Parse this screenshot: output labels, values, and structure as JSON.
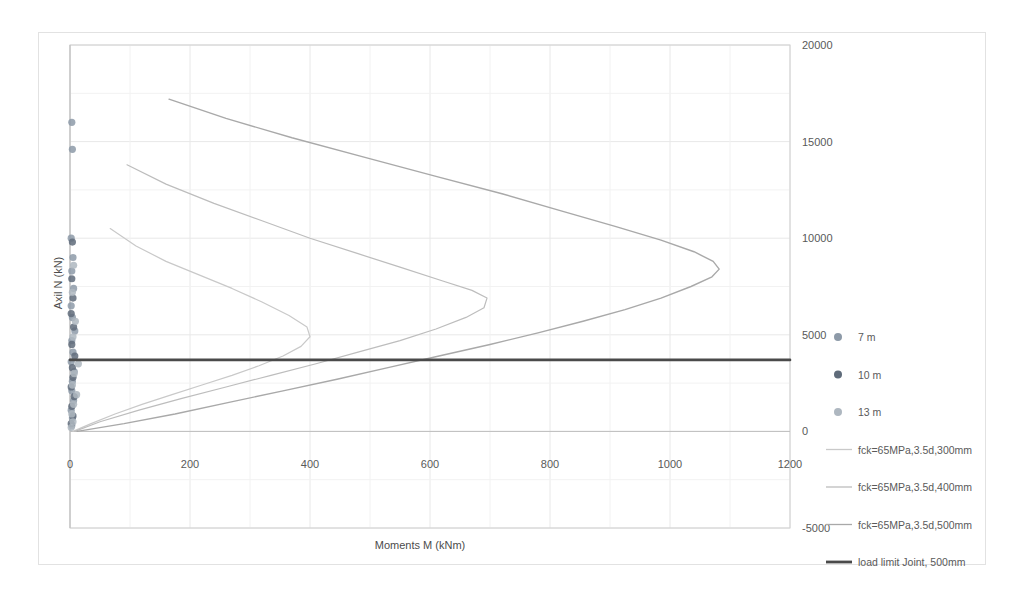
{
  "chart_data": {
    "type": "scatter",
    "title": "",
    "xlabel": "Moments M (kNm)",
    "ylabel": "Axil N (kN)",
    "xlim": [
      0,
      1200
    ],
    "ylim": [
      -5000,
      20000
    ],
    "xticks": [
      "0",
      "200",
      "400",
      "600",
      "800",
      "1000",
      "1200"
    ],
    "xtick_values": [
      0,
      200,
      400,
      600,
      800,
      1000,
      1200
    ],
    "yticks": [
      "-5000",
      "0",
      "5000",
      "10000",
      "15000",
      "20000"
    ],
    "ytick_values": [
      -5000,
      0,
      5000,
      10000,
      15000,
      20000
    ],
    "grid": true,
    "legend_position": "right",
    "series": [
      {
        "name": "7 m",
        "type": "scatter",
        "marker": "circle",
        "color": "#8d9aa8",
        "points": [
          [
            3,
            16000
          ],
          [
            4,
            14600
          ],
          [
            2,
            10000
          ],
          [
            5,
            9000
          ],
          [
            3,
            8300
          ],
          [
            6,
            7400
          ],
          [
            2,
            6500
          ],
          [
            4,
            5900
          ],
          [
            8,
            5200
          ],
          [
            3,
            4700
          ],
          [
            5,
            4100
          ],
          [
            2,
            3600
          ],
          [
            7,
            3100
          ],
          [
            4,
            2600
          ],
          [
            3,
            2100
          ],
          [
            6,
            1600
          ],
          [
            2,
            1100
          ],
          [
            4,
            700
          ],
          [
            3,
            300
          ]
        ]
      },
      {
        "name": "10 m",
        "type": "scatter",
        "marker": "circle",
        "color": "#5f6b7a",
        "points": [
          [
            4,
            9800
          ],
          [
            3,
            7900
          ],
          [
            5,
            6900
          ],
          [
            2,
            6100
          ],
          [
            6,
            5400
          ],
          [
            3,
            4500
          ],
          [
            8,
            3900
          ],
          [
            4,
            3300
          ],
          [
            5,
            2800
          ],
          [
            2,
            2300
          ],
          [
            7,
            1800
          ],
          [
            3,
            1300
          ],
          [
            5,
            800
          ],
          [
            2,
            400
          ]
        ]
      },
      {
        "name": "13 m",
        "type": "scatter",
        "marker": "circle",
        "color": "#aeb7c0",
        "points": [
          [
            6,
            8600
          ],
          [
            4,
            7200
          ],
          [
            9,
            5700
          ],
          [
            5,
            4900
          ],
          [
            14,
            3500
          ],
          [
            7,
            3000
          ],
          [
            4,
            2400
          ],
          [
            11,
            1900
          ],
          [
            6,
            1400
          ],
          [
            3,
            900
          ],
          [
            5,
            500
          ],
          [
            2,
            200
          ]
        ]
      },
      {
        "name": "fck=65MPa,3.5d,300mm",
        "type": "line",
        "color": "#c9c9c9",
        "width": 1.2,
        "points": [
          [
            67,
            10500
          ],
          [
            110,
            9600
          ],
          [
            160,
            8800
          ],
          [
            215,
            8100
          ],
          [
            270,
            7400
          ],
          [
            320,
            6700
          ],
          [
            365,
            6000
          ],
          [
            395,
            5400
          ],
          [
            400,
            4900
          ],
          [
            385,
            4400
          ],
          [
            355,
            3900
          ],
          [
            315,
            3400
          ],
          [
            270,
            2900
          ],
          [
            220,
            2400
          ],
          [
            170,
            1900
          ],
          [
            120,
            1400
          ],
          [
            75,
            900
          ],
          [
            35,
            400
          ],
          [
            5,
            0
          ]
        ]
      },
      {
        "name": "fck=65MPa,3.5d,400mm",
        "type": "line",
        "color": "#bdbdbd",
        "width": 1.2,
        "points": [
          [
            95,
            13800
          ],
          [
            160,
            12800
          ],
          [
            240,
            11800
          ],
          [
            320,
            10900
          ],
          [
            400,
            10000
          ],
          [
            480,
            9200
          ],
          [
            550,
            8500
          ],
          [
            620,
            7800
          ],
          [
            670,
            7300
          ],
          [
            695,
            6900
          ],
          [
            690,
            6400
          ],
          [
            660,
            5900
          ],
          [
            610,
            5300
          ],
          [
            550,
            4700
          ],
          [
            480,
            4100
          ],
          [
            410,
            3500
          ],
          [
            335,
            2900
          ],
          [
            260,
            2300
          ],
          [
            185,
            1700
          ],
          [
            115,
            1100
          ],
          [
            50,
            500
          ],
          [
            8,
            0
          ]
        ]
      },
      {
        "name": "fck=65MPa,3.5d,500mm",
        "type": "line",
        "color": "#a9a9a9",
        "width": 1.4,
        "points": [
          [
            165,
            17200
          ],
          [
            260,
            16200
          ],
          [
            370,
            15200
          ],
          [
            490,
            14200
          ],
          [
            610,
            13200
          ],
          [
            720,
            12300
          ],
          [
            820,
            11400
          ],
          [
            910,
            10600
          ],
          [
            985,
            9900
          ],
          [
            1040,
            9300
          ],
          [
            1072,
            8800
          ],
          [
            1082,
            8400
          ],
          [
            1070,
            8000
          ],
          [
            1035,
            7500
          ],
          [
            985,
            6900
          ],
          [
            925,
            6300
          ],
          [
            855,
            5700
          ],
          [
            780,
            5100
          ],
          [
            700,
            4500
          ],
          [
            615,
            3900
          ],
          [
            530,
            3300
          ],
          [
            445,
            2700
          ],
          [
            355,
            2100
          ],
          [
            265,
            1500
          ],
          [
            175,
            900
          ],
          [
            90,
            400
          ],
          [
            12,
            0
          ]
        ]
      },
      {
        "name": "load limit Joint, 500mm",
        "type": "line",
        "color": "#4a4a4a",
        "width": 2.6,
        "constant_y": 3700,
        "points": [
          [
            0,
            3700
          ],
          [
            1200,
            3700
          ]
        ]
      }
    ],
    "legend_entries": [
      {
        "label": "7 m",
        "marker": "dot",
        "color": "#8d9aa8"
      },
      {
        "label": "10 m",
        "marker": "dot",
        "color": "#5f6b7a"
      },
      {
        "label": "13 m",
        "marker": "dot",
        "color": "#aeb7c0"
      },
      {
        "label": "fck=65MPa,3.5d,300mm",
        "marker": "line",
        "color": "#c9c9c9"
      },
      {
        "label": "fck=65MPa,3.5d,400mm",
        "marker": "line",
        "color": "#bdbdbd"
      },
      {
        "label": "fck=65MPa,3.5d,500mm",
        "marker": "line",
        "color": "#a9a9a9"
      },
      {
        "label": "load limit Joint, 500mm",
        "marker": "line-thick",
        "color": "#4a4a4a"
      }
    ]
  },
  "colors": {
    "grid": "#e8e8e8",
    "axis": "#d0d0d0",
    "frame": "#e2e2e2",
    "text": "#595959",
    "load_limit": "#4a4a4a"
  }
}
